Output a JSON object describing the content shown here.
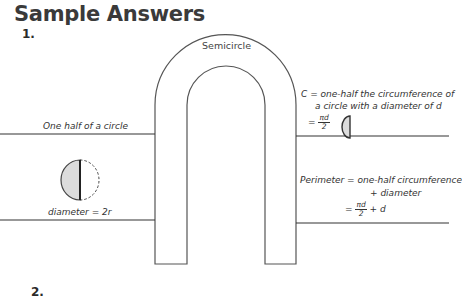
{
  "header": {
    "title": "Sample Answers",
    "item_number": "1.",
    "next_item_number": "2."
  },
  "diagram": {
    "center_label": "Semicircle",
    "left_top_label": "One half of a circle",
    "left_bottom_label": "diameter = 2r",
    "right_top": {
      "line1": "C = one-half the circumference of",
      "line2": "a circle with a diameter of d",
      "eq_prefix": "=",
      "frac_num": "πd",
      "frac_den": "2"
    },
    "right_bottom": {
      "line1": "Perimeter = one-half circumference",
      "line2": "+ diameter",
      "eq_prefix": "=",
      "frac_num": "πd",
      "frac_den": "2",
      "eq_suffix": "+ d"
    },
    "colors": {
      "stroke": "#555555",
      "fill_shaded": "#dcdcdc"
    }
  }
}
